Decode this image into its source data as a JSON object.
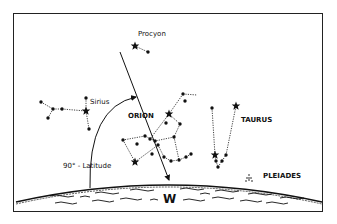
{
  "diagram": {
    "frame": {
      "x": 13,
      "y": 13,
      "w": 310,
      "h": 199,
      "stroke": "#222222"
    },
    "ink": "#111111",
    "labels": {
      "procyon": {
        "text": "Procyon",
        "x": 138,
        "y": 36
      },
      "sirius": {
        "text": "Sirius",
        "x": 90,
        "y": 104
      },
      "orion": {
        "text": "ORION",
        "x": 128,
        "y": 118
      },
      "taurus": {
        "text": "TAURUS",
        "x": 241,
        "y": 122
      },
      "pleiades": {
        "text": "PLEIADES",
        "x": 263,
        "y": 178
      },
      "latitude": {
        "text": "90° - Latitude",
        "x": 63,
        "y": 168
      },
      "direction": {
        "text": "W",
        "x": 163,
        "y": 203
      }
    },
    "procyon_group": {
      "stars": [
        [
          135,
          46
        ]
      ],
      "dots": [
        [
          148,
          52
        ]
      ],
      "lines": [
        [
          [
            135,
            46
          ],
          [
            148,
            52
          ]
        ]
      ]
    },
    "canis_major": {
      "stars": [
        [
          86,
          111
        ]
      ],
      "dots": [
        [
          41,
          102
        ],
        [
          53,
          109
        ],
        [
          62,
          109
        ],
        [
          48,
          118
        ],
        [
          86,
          98
        ],
        [
          89,
          129
        ]
      ],
      "lines": [
        [
          [
            41,
            102
          ],
          [
            53,
            109
          ]
        ],
        [
          [
            53,
            109
          ],
          [
            62,
            109
          ]
        ],
        [
          [
            62,
            109
          ],
          [
            86,
            111
          ]
        ],
        [
          [
            53,
            109
          ],
          [
            48,
            118
          ]
        ],
        [
          [
            86,
            98
          ],
          [
            86,
            111
          ]
        ],
        [
          [
            86,
            111
          ],
          [
            89,
            129
          ]
        ]
      ]
    },
    "orion": {
      "stars": [
        [
          169,
          114
        ],
        [
          135,
          162
        ]
      ],
      "dots": [
        [
          183,
          94
        ],
        [
          185,
          101
        ],
        [
          166,
          123
        ],
        [
          180,
          124
        ],
        [
          174,
          137
        ],
        [
          145,
          136
        ],
        [
          150,
          139
        ],
        [
          155,
          141
        ],
        [
          123,
          140
        ],
        [
          137,
          144
        ],
        [
          158,
          145
        ],
        [
          152,
          154
        ],
        [
          164,
          157
        ],
        [
          171,
          161
        ],
        [
          179,
          160
        ],
        [
          186,
          157
        ],
        [
          191,
          154
        ]
      ],
      "lines": [
        [
          [
            183,
            94
          ],
          [
            197,
            95
          ]
        ],
        [
          [
            183,
            94
          ],
          [
            169,
            114
          ]
        ],
        [
          [
            169,
            114
          ],
          [
            150,
            139
          ]
        ],
        [
          [
            169,
            114
          ],
          [
            180,
            124
          ]
        ],
        [
          [
            180,
            124
          ],
          [
            174,
            137
          ]
        ],
        [
          [
            174,
            137
          ],
          [
            155,
            141
          ]
        ],
        [
          [
            155,
            141
          ],
          [
            145,
            136
          ]
        ],
        [
          [
            145,
            136
          ],
          [
            123,
            140
          ]
        ],
        [
          [
            123,
            140
          ],
          [
            135,
            162
          ]
        ],
        [
          [
            135,
            162
          ],
          [
            158,
            145
          ]
        ],
        [
          [
            174,
            137
          ],
          [
            179,
            160
          ]
        ],
        [
          [
            158,
            145
          ],
          [
            164,
            157
          ]
        ],
        [
          [
            164,
            157
          ],
          [
            171,
            161
          ]
        ],
        [
          [
            171,
            161
          ],
          [
            179,
            160
          ]
        ],
        [
          [
            179,
            160
          ],
          [
            186,
            157
          ]
        ],
        [
          [
            186,
            157
          ],
          [
            191,
            154
          ]
        ]
      ]
    },
    "taurus": {
      "stars": [
        [
          236,
          106
        ],
        [
          215,
          155
        ]
      ],
      "dots": [
        [
          212,
          108
        ],
        [
          216,
          161
        ],
        [
          218,
          167
        ],
        [
          222,
          161
        ],
        [
          226,
          155
        ]
      ],
      "lines": [
        [
          [
            212,
            108
          ],
          [
            215,
            155
          ]
        ],
        [
          [
            215,
            155
          ],
          [
            216,
            161
          ]
        ],
        [
          [
            216,
            161
          ],
          [
            218,
            167
          ]
        ],
        [
          [
            218,
            167
          ],
          [
            222,
            161
          ]
        ],
        [
          [
            222,
            161
          ],
          [
            226,
            155
          ]
        ],
        [
          [
            226,
            155
          ],
          [
            236,
            106
          ]
        ]
      ]
    },
    "pleiades_mark": {
      "x": 249,
      "y": 178
    },
    "meridian_arrow": {
      "from": [
        120,
        52
      ],
      "to": [
        169,
        180
      ]
    },
    "latitude_arc": {
      "start": [
        90,
        188
      ],
      "end": [
        136,
        97
      ]
    },
    "horizon": {
      "left": [
        16,
        202
      ],
      "peak": [
        168,
        183
      ],
      "right": [
        322,
        202
      ]
    }
  }
}
